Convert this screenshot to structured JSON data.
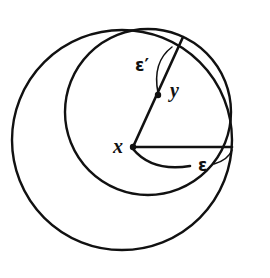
{
  "figure": {
    "kind": "geometry-diagram",
    "background_color": "#ffffff",
    "stroke_color": "#111111",
    "width": 270,
    "height": 278
  },
  "labels": {
    "x": "x",
    "y": "y",
    "epsilon_prime": "ε′",
    "epsilon": "ε"
  },
  "geometry": {
    "outer_circle": {
      "cx": 122,
      "cy": 140,
      "r": 110
    },
    "inner_circle": {
      "cx": 148,
      "cy": 112,
      "r": 83
    },
    "vertex_x": {
      "x": 133,
      "y": 147
    },
    "apex_point": {
      "x": 183,
      "y": 37
    },
    "midpoint_dot": {
      "x": 158,
      "y": 95
    },
    "horizontal_end": {
      "x": 232,
      "y": 147
    },
    "epsilon_arc_end": {
      "x": 174,
      "y": 167
    }
  }
}
